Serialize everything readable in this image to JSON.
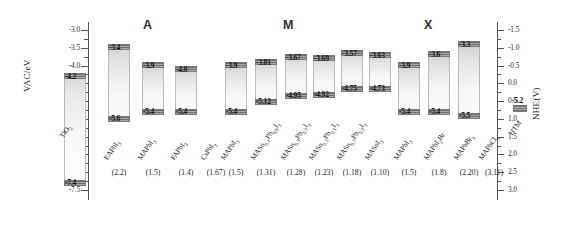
{
  "figure": {
    "left_axis": {
      "title": "VAC/eV",
      "ticks": [
        "-3.0",
        "-3.5",
        "-4.0",
        "-4.5",
        "-5.0",
        "-5.5",
        "-6.0",
        "-6.5",
        "-7.0",
        "-7.5"
      ],
      "min": -7.5,
      "max": -3.0
    },
    "right_axis": {
      "title": "NHE(V)",
      "ticks": [
        "-1.5",
        "-1.0",
        "-0.5",
        "0.0",
        "0.5",
        "1.0",
        "1.5",
        "2.0",
        "2.5",
        "3.0"
      ],
      "min": -1.5,
      "max": 3.0
    },
    "groups": [
      {
        "id": "A",
        "label": "A"
      },
      {
        "id": "M",
        "label": "M"
      },
      {
        "id": "X",
        "label": "X"
      }
    ]
  },
  "chart_data": {
    "type": "bar",
    "xlabel": "",
    "ylabel": "VAC/eV",
    "ylabel_right": "NHE(V)",
    "ylim": [
      -7.5,
      -3.0
    ],
    "ylim_right": [
      3.0,
      -1.5
    ],
    "grid": false,
    "legend": "none",
    "bars": [
      {
        "name": "TiO2",
        "label_html": "TiO<sub>2</sub>",
        "group": "reference",
        "cbm": -4.2,
        "vbm": -7.4,
        "cbm_text": "-4.2",
        "vbm_text": "-7.4",
        "gap": ""
      },
      {
        "name": "EAPbI3",
        "label_html": "EAPbI<sub>3</sub>",
        "group": "A",
        "cbm": -3.4,
        "vbm": -5.6,
        "cbm_text": "-3.4",
        "vbm_text": "-5.6",
        "gap": "(2.2)"
      },
      {
        "name": "MAPbI3",
        "label_html": "MAPbI<sub>3</sub>",
        "group": "A",
        "cbm": -3.9,
        "vbm": -5.4,
        "cbm_text": "-3.9",
        "vbm_text": "-5.4",
        "gap": "(1.5)"
      },
      {
        "name": "FAPbI3",
        "label_html": "FAPbI<sub>3</sub>",
        "group": "A",
        "cbm": -4.0,
        "vbm": -5.4,
        "cbm_text": "-4.0",
        "vbm_text": "-5.4",
        "gap": "(1.4)"
      },
      {
        "name": "CsPbI3",
        "label_html": "CsPbI<sub>3</sub>",
        "group": "A",
        "cbm": null,
        "vbm": null,
        "cbm_text": "",
        "vbm_text": "",
        "gap": "(1.67)"
      },
      {
        "name": "MAPbI3_M",
        "label_html": "MAPbI<sub>3</sub>",
        "group": "M",
        "cbm": -3.9,
        "vbm": -5.4,
        "cbm_text": "-3.9",
        "vbm_text": "-5.4",
        "gap": "(1.5)"
      },
      {
        "name": "MASn0.1Pb0.9I3",
        "label_html": "MASn<sub>0.1</sub>Pb<sub>0.9</sub>I<sub>3</sub>",
        "group": "M",
        "cbm": -3.81,
        "vbm": -5.12,
        "cbm_text": "-3.81",
        "vbm_text": "-5.12",
        "gap": "(1.31)"
      },
      {
        "name": "MASn0.3Pb0.7I3",
        "label_html": "MASn<sub>0.3</sub>Pb<sub>0.7</sub>I<sub>3</sub>",
        "group": "M",
        "cbm": -3.67,
        "vbm": -4.95,
        "cbm_text": "-3.67",
        "vbm_text": "-4.95",
        "gap": "(1.28)"
      },
      {
        "name": "MASn0.5Pb0.5I3",
        "label_html": "MASn<sub>0.5</sub>Pb<sub>0.5</sub>I<sub>3</sub>",
        "group": "M",
        "cbm": -3.69,
        "vbm": -4.92,
        "cbm_text": "-3.69",
        "vbm_text": "-4.92",
        "gap": "(1.23)"
      },
      {
        "name": "MASn0.7Pb0.3I3",
        "label_html": "MASn<sub>0.7</sub>Pb<sub>0.3</sub>I<sub>3</sub>",
        "group": "M",
        "cbm": -3.57,
        "vbm": -4.75,
        "cbm_text": "-3.57",
        "vbm_text": "-4.75",
        "gap": "(1.18)"
      },
      {
        "name": "MASnI3",
        "label_html": "MASnI<sub>3</sub>",
        "group": "M",
        "cbm": -3.63,
        "vbm": -4.73,
        "cbm_text": "-3.63",
        "vbm_text": "-4.73",
        "gap": "(1.10)"
      },
      {
        "name": "MAPbI3_X",
        "label_html": "MAPbI<sub>3</sub>",
        "group": "X",
        "cbm": -3.9,
        "vbm": -5.4,
        "cbm_text": "-3.9",
        "vbm_text": "-5.4",
        "gap": "(1.5)"
      },
      {
        "name": "MAPbI2Br",
        "label_html": "MAPbI<sub>2</sub>Br",
        "group": "X",
        "cbm": -3.6,
        "vbm": -5.4,
        "cbm_text": "-3.6",
        "vbm_text": "-5.4",
        "gap": "(1.8)"
      },
      {
        "name": "MAPbBr3",
        "label_html": "MAPbBr<sub>3</sub>",
        "group": "X",
        "cbm": -3.3,
        "vbm": -5.5,
        "cbm_text": "-3.3",
        "vbm_text": "-5.5",
        "gap": "(2.20)"
      },
      {
        "name": "MAPbCl3",
        "label_html": "MAPbCl<sub>3</sub>",
        "group": "X",
        "cbm": null,
        "vbm": null,
        "cbm_text": "",
        "vbm_text": "",
        "gap": "(3.11)"
      },
      {
        "name": "HTM",
        "label_html": "HTM",
        "group": "htm",
        "cbm": -5.2,
        "vbm": -5.2,
        "cbm_text": "-5.2",
        "vbm_text": "",
        "gap": ""
      }
    ]
  }
}
